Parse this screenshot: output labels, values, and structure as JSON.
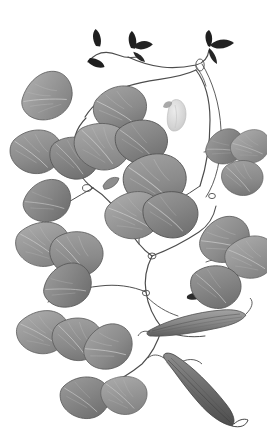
{
  "image": {
    "kind": "botanical-specimen-illustration",
    "subject": "climbing bean vine with trifoliate leaves and seed pods",
    "technique": "grayscale pressed-specimen scan",
    "width": 267,
    "height": 443,
    "background_color": "#ffffff",
    "caption": "",
    "text_present": "none"
  },
  "palette": {
    "background": "#ffffff",
    "leaf_fill_light": "#a9a9a9",
    "leaf_fill_mid": "#8d8d8d",
    "leaf_fill_dark": "#757575",
    "leaf_edge": "#5a5a5a",
    "vein": "#c9c9c9",
    "stem": "#4a4a4a",
    "stem_light": "#6b6b6b",
    "bud_dark": "#1d1d1d",
    "pod_fill": "#8a8a8a",
    "pod_dark": "#5d5d5d",
    "pod_line": "#4c4c4c",
    "flower_fill": "#d8d8d8",
    "flower_edge": "#b4b4b4"
  },
  "structures": {
    "leaf_clusters": [
      {
        "name": "upper-left-cluster",
        "leaf_count": 3,
        "cx": 62,
        "cy": 130
      },
      {
        "name": "upper-middle-cluster",
        "leaf_count": 3,
        "cx": 118,
        "cy": 132
      },
      {
        "name": "center-cluster",
        "leaf_count": 3,
        "cx": 148,
        "cy": 205
      },
      {
        "name": "mid-left-cluster",
        "leaf_count": 3,
        "cx": 48,
        "cy": 235
      },
      {
        "name": "right-cluster",
        "leaf_count": 3,
        "cx": 235,
        "cy": 168
      },
      {
        "name": "lower-right-cluster",
        "leaf_count": 3,
        "cx": 218,
        "cy": 272
      },
      {
        "name": "lower-left-cluster",
        "leaf_count": 3,
        "cx": 60,
        "cy": 320
      },
      {
        "name": "bottom-cluster",
        "leaf_count": 3,
        "cx": 98,
        "cy": 390
      }
    ],
    "pods": [
      {
        "name": "upper-pod",
        "x": 152,
        "y": 312,
        "length": 92,
        "tone": "#8a8a8a"
      },
      {
        "name": "lower-pod",
        "x": 160,
        "y": 368,
        "length": 96,
        "tone": "#6e6e6e"
      }
    ],
    "buds": [
      {
        "name": "apex-bud-left",
        "x": 92,
        "y": 32
      },
      {
        "name": "apex-bud-center",
        "x": 131,
        "y": 28
      },
      {
        "name": "apex-bud-right",
        "x": 207,
        "y": 42
      },
      {
        "name": "stipule-bud-left",
        "x": 66,
        "y": 100
      },
      {
        "name": "stipule-bud-mid",
        "x": 100,
        "y": 188
      },
      {
        "name": "stipule-bud-lower",
        "x": 190,
        "y": 297
      }
    ],
    "flower": {
      "name": "pale-flower",
      "x": 176,
      "y": 110
    },
    "stem_count": 6,
    "tendril_nodes": 5
  }
}
